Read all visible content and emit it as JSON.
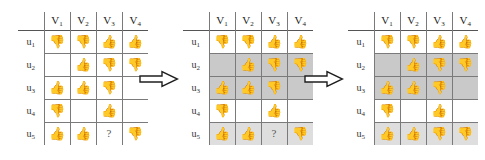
{
  "diagram": {
    "arrow_icon": "right-arrow-icon",
    "arrow_count": 2,
    "marks": {
      "thumbs_up": "👍",
      "thumbs_down": "👎",
      "unknown": "?",
      "empty": ""
    },
    "colors": {
      "grid_line": "#7a7a7a",
      "shade_dark": "#c9c9c9",
      "shade_light": "#dedede",
      "text": "#222222"
    }
  },
  "tables": [
    {
      "name": "initial-rating-matrix",
      "corner_label": "",
      "columns": [
        "V1",
        "V2",
        "V3",
        "V4"
      ],
      "column_labels": [
        "V",
        "V",
        "V",
        "V"
      ],
      "column_subs": [
        "1",
        "2",
        "3",
        "4"
      ],
      "rows": [
        {
          "label": "u",
          "sub": "1",
          "shade": "none",
          "cells": [
            "thumbs_down",
            "thumbs_down",
            "thumbs_up",
            "thumbs_up"
          ]
        },
        {
          "label": "u",
          "sub": "2",
          "shade": "none",
          "cells": [
            "empty",
            "thumbs_up",
            "thumbs_down",
            "thumbs_down"
          ]
        },
        {
          "label": "u",
          "sub": "3",
          "shade": "none",
          "cells": [
            "thumbs_up",
            "thumbs_up",
            "thumbs_down",
            "empty"
          ]
        },
        {
          "label": "u",
          "sub": "4",
          "shade": "none",
          "cells": [
            "thumbs_down",
            "empty",
            "thumbs_up",
            "empty"
          ]
        },
        {
          "label": "u",
          "sub": "5",
          "shade": "none",
          "cells": [
            "thumbs_up",
            "thumbs_up",
            "unknown",
            "thumbs_down"
          ]
        }
      ]
    },
    {
      "name": "neighbor-selection-matrix",
      "corner_label": "",
      "columns": [
        "V1",
        "V2",
        "V3",
        "V4"
      ],
      "column_labels": [
        "V",
        "V",
        "V",
        "V"
      ],
      "column_subs": [
        "1",
        "2",
        "3",
        "4"
      ],
      "rows": [
        {
          "label": "u",
          "sub": "1",
          "shade": "none",
          "cells": [
            "thumbs_down",
            "thumbs_down",
            "thumbs_up",
            "thumbs_up"
          ]
        },
        {
          "label": "u",
          "sub": "2",
          "shade": "dark",
          "cells": [
            "empty",
            "thumbs_up",
            "thumbs_down",
            "thumbs_down"
          ]
        },
        {
          "label": "u",
          "sub": "3",
          "shade": "dark",
          "cells": [
            "thumbs_up",
            "thumbs_up",
            "thumbs_down",
            "empty"
          ]
        },
        {
          "label": "u",
          "sub": "4",
          "shade": "none",
          "cells": [
            "thumbs_down",
            "empty",
            "thumbs_up",
            "empty"
          ]
        },
        {
          "label": "u",
          "sub": "5",
          "shade": "light",
          "cells": [
            "thumbs_up",
            "thumbs_up",
            "unknown",
            "thumbs_down"
          ]
        }
      ]
    },
    {
      "name": "predicted-rating-matrix",
      "corner_label": "",
      "columns": [
        "V1",
        "V2",
        "V3",
        "V4"
      ],
      "column_labels": [
        "V",
        "V",
        "V",
        "V"
      ],
      "column_subs": [
        "1",
        "2",
        "3",
        "4"
      ],
      "rows": [
        {
          "label": "u",
          "sub": "1",
          "shade": "none",
          "cells": [
            "thumbs_down",
            "thumbs_down",
            "thumbs_up",
            "thumbs_up"
          ]
        },
        {
          "label": "u",
          "sub": "2",
          "shade": "dark",
          "cells": [
            "empty",
            "thumbs_up",
            "thumbs_down",
            "thumbs_down"
          ]
        },
        {
          "label": "u",
          "sub": "3",
          "shade": "dark",
          "cells": [
            "thumbs_up",
            "thumbs_up",
            "thumbs_down",
            "empty"
          ]
        },
        {
          "label": "u",
          "sub": "4",
          "shade": "none",
          "cells": [
            "thumbs_down",
            "empty",
            "thumbs_up",
            "empty"
          ]
        },
        {
          "label": "u",
          "sub": "5",
          "shade": "light",
          "cells": [
            "thumbs_up",
            "thumbs_up",
            "thumbs_down",
            "thumbs_down"
          ]
        }
      ]
    }
  ]
}
